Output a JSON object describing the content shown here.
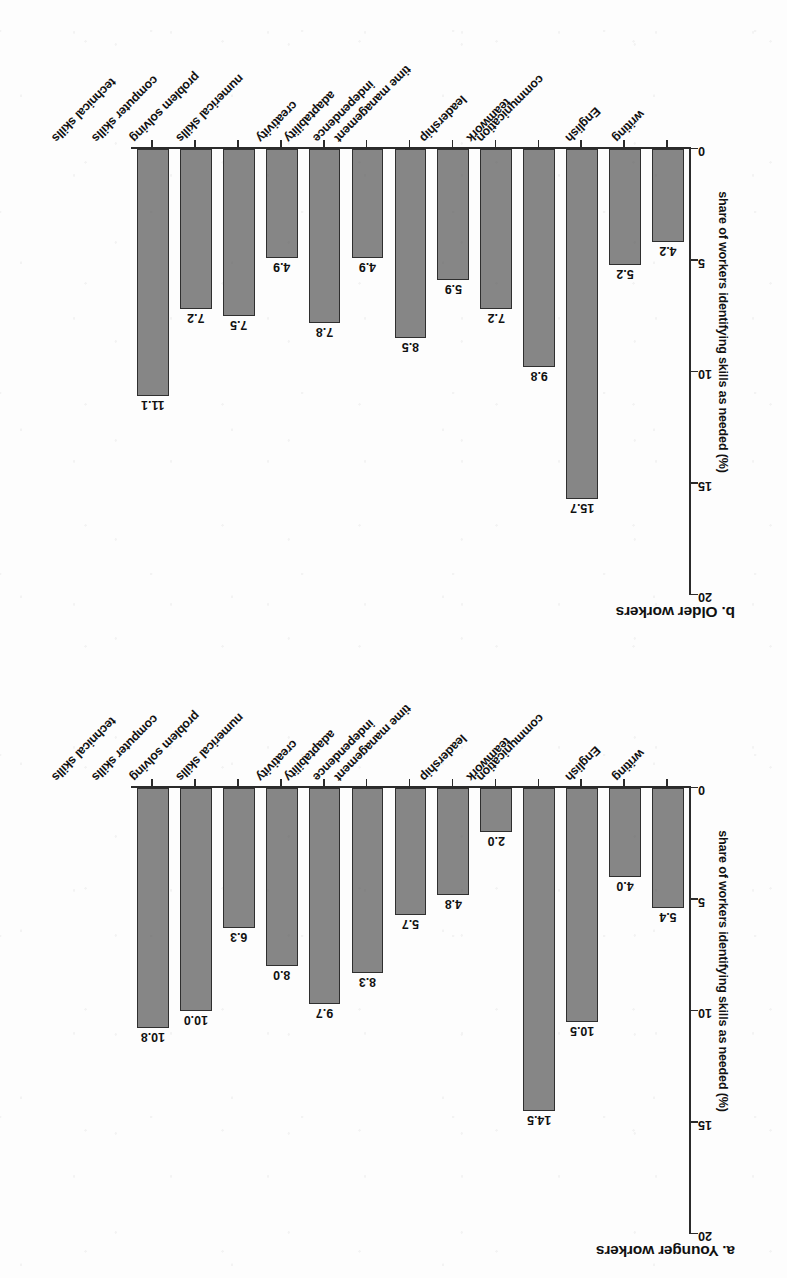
{
  "figure": {
    "background_color": "#fdfdfd",
    "bar_fill_color": "#868686",
    "bar_border_color": "#2f2f2f",
    "axis_color": "#2b2b2b",
    "orientation_note": "page scanned upside down (rotated 180 degrees)"
  },
  "chart_data": [
    {
      "type": "bar",
      "title": "a. Younger workers",
      "xlabel": "",
      "ylabel": "share of workers identifying skills as needed (%)",
      "ylim": [
        0,
        20
      ],
      "yticks": [
        "0",
        "5",
        "10",
        "15",
        "20"
      ],
      "grid": false,
      "legend": "none",
      "categories": [
        "writing",
        "English",
        "communication",
        "teamwork",
        "leadership",
        "time management",
        "independence",
        "adaptability",
        "creativity",
        "numerical skills",
        "problem solving",
        "computer skills",
        "technical skills"
      ],
      "values": [
        5.4,
        4.0,
        10.5,
        14.5,
        2.0,
        4.8,
        5.7,
        8.3,
        9.7,
        8.0,
        6.3,
        10.0,
        10.8
      ],
      "value_labels": [
        "5.4",
        "4.0",
        "10.5",
        "14.5",
        "2.0",
        "4.8",
        "5.7",
        "8.3",
        "9.7",
        "8.0",
        "6.3",
        "10.0",
        "10.8"
      ]
    },
    {
      "type": "bar",
      "title": "b. Older workers",
      "xlabel": "",
      "ylabel": "share of workers identifying skills as needed (%)",
      "ylim": [
        0,
        20
      ],
      "yticks": [
        "0",
        "5",
        "10",
        "15",
        "20"
      ],
      "grid": false,
      "legend": "none",
      "categories": [
        "writing",
        "English",
        "communication",
        "teamwork",
        "leadership",
        "time management",
        "independence",
        "adaptability",
        "creativity",
        "numerical skills",
        "problem solving",
        "computer skills",
        "technical skills"
      ],
      "values": [
        4.2,
        5.2,
        15.7,
        9.8,
        7.2,
        5.9,
        8.5,
        4.9,
        7.8,
        4.9,
        7.5,
        7.2,
        11.1
      ],
      "value_labels": [
        "4.2",
        "5.2",
        "15.7",
        "9.8",
        "7.2",
        "5.9",
        "8.5",
        "4.9",
        "7.8",
        "4.9",
        "7.5",
        "7.2",
        "11.1"
      ]
    }
  ]
}
